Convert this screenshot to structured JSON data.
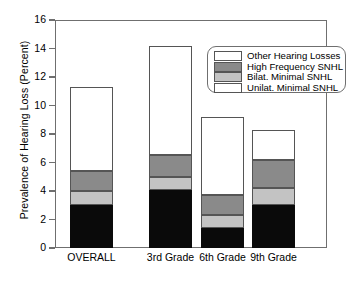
{
  "chart_data": {
    "type": "bar",
    "stacked": true,
    "title": "",
    "xlabel": "",
    "ylabel": "Prevalence of Hearing Loss (Percent)",
    "ylim": [
      0,
      16
    ],
    "yticks": [
      0,
      2,
      4,
      6,
      8,
      10,
      12,
      14,
      16
    ],
    "ytick_labels": [
      "0",
      "2",
      "4",
      "6",
      "8",
      "10",
      "12",
      "14",
      "16"
    ],
    "grid": false,
    "legend_position": "top-right",
    "categories": [
      "OVERALL",
      "3rd Grade",
      "6th Grade",
      "9th Grade"
    ],
    "series": [
      {
        "name": "Unilat. Minimal SNHL",
        "color": "#0a0a0a",
        "values": [
          3.0,
          4.1,
          1.4,
          3.0
        ]
      },
      {
        "name": "Bilat. Minimal SNHL",
        "color": "#c3c3c3",
        "values": [
          1.0,
          0.9,
          0.9,
          1.2
        ]
      },
      {
        "name": "High Frequency SNHL",
        "color": "#8a8a8a",
        "values": [
          1.4,
          1.5,
          1.4,
          2.0
        ]
      },
      {
        "name": "Other Hearing Losses",
        "color": "#ffffff",
        "values": [
          5.9,
          7.7,
          5.5,
          2.1
        ]
      }
    ],
    "totals": [
      11.3,
      14.2,
      9.2,
      8.3
    ],
    "legend_entries": [
      {
        "label": "Other Hearing Losses",
        "swatch": "white"
      },
      {
        "label": "High Frequency SNHL",
        "swatch": "dgray"
      },
      {
        "label": "Bilat. Minimal SNHL",
        "swatch": "lgray"
      },
      {
        "label": "Unilat. Minimal SNHL",
        "swatch": "white"
      }
    ]
  },
  "axis": {
    "y_title": "Prevalence of Hearing Loss (Percent)"
  },
  "colors": {
    "frame": "#6f6f6f",
    "black_segment": "#0a0a0a",
    "dark_gray_segment": "#8a8a8a",
    "light_gray_segment": "#c3c3c3",
    "white_segment": "#ffffff"
  }
}
